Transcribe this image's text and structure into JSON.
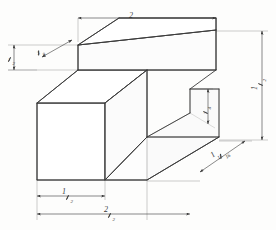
{
  "drawing": {
    "type": "isometric-pictorial",
    "subject": "stepped-block",
    "paper_color": "#fdfdfc",
    "line_color": "#3a3a3a",
    "dimension_line_color": "#555555"
  },
  "dimensions": {
    "top_width": {
      "label": "2",
      "whole": "2",
      "numerator": "",
      "denominator": ""
    },
    "left_height": {
      "label": "1/2",
      "whole": "",
      "numerator": "1",
      "denominator": "2"
    },
    "top_left_thickness": {
      "label": "3/8",
      "whole": "",
      "numerator": "3",
      "denominator": "8"
    },
    "right_height": {
      "label": "1 1/2",
      "whole": "1",
      "numerator": "1",
      "denominator": "2"
    },
    "step_height": {
      "label": "3/4",
      "whole": "",
      "numerator": "3",
      "denominator": "4"
    },
    "depth": {
      "label": "1 13/16",
      "whole": "1",
      "numerator": "13",
      "denominator": "16"
    },
    "bottom_inner_width": {
      "label": "1 1/2",
      "whole": "1",
      "numerator": "1",
      "denominator": "2"
    },
    "bottom_overall_width": {
      "label": "2 1/2",
      "whole": "2",
      "numerator": "1",
      "denominator": "2"
    }
  },
  "geometry": {
    "object_outline": "M37,103 L37,180 L147,180 L219,140 L219,88 L190,88 L190,112 L147,137 L147,180",
    "top_face": "M37,103 L78,70 L216,70 L178,103 Z",
    "upper_block_front": "M78,70 L78,45 L216,30 L216,70 Z"
  }
}
